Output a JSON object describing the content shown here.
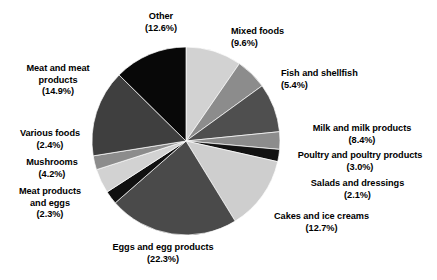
{
  "chart_data": {
    "type": "pie",
    "title": "",
    "subtitle": "",
    "xlabel": "",
    "ylabel": "",
    "legend_position": "outside-labels",
    "grid": false,
    "units": "percent",
    "start_angle_deg": 0,
    "direction": "clockwise",
    "categories": [
      "Mixed foods",
      "Fish and shellfish",
      "Milk and milk products",
      "Poultry and poultry products",
      "Salads and dressings",
      "Cakes and ice creams",
      "Eggs and egg products",
      "Meat products and eggs",
      "Mushrooms",
      "Various foods",
      "Meat and meat products",
      "Other"
    ],
    "values": [
      9.6,
      5.4,
      8.4,
      3.0,
      2.1,
      12.7,
      22.3,
      2.3,
      4.2,
      2.4,
      14.9,
      12.6
    ],
    "colors": [
      "#d2d2d2",
      "#8c8c8c",
      "#4f4f4f",
      "#8c8c8c",
      "#121212",
      "#cecece",
      "#4a4a4a",
      "#101010",
      "#d2d2d2",
      "#8c8c8c",
      "#3f3f3f",
      "#080808"
    ],
    "slices": [
      {
        "name": "Mixed foods",
        "value": 9.6,
        "pct_text": "(9.6%)",
        "color": "#d2d2d2"
      },
      {
        "name": "Fish and shellfish",
        "value": 5.4,
        "pct_text": "(5.4%)",
        "color": "#8c8c8c"
      },
      {
        "name": "Milk and milk products",
        "value": 8.4,
        "pct_text": "(8.4%)",
        "color": "#4f4f4f"
      },
      {
        "name": "Poultry and poultry products",
        "value": 3.0,
        "pct_text": "(3.0%)",
        "color": "#8c8c8c"
      },
      {
        "name": "Salads and dressings",
        "value": 2.1,
        "pct_text": "(2.1%)",
        "color": "#121212"
      },
      {
        "name": "Cakes and ice creams",
        "value": 12.7,
        "pct_text": "(12.7%)",
        "color": "#cecece"
      },
      {
        "name": "Eggs and egg products",
        "value": 22.3,
        "pct_text": "(22.3%)",
        "color": "#4a4a4a"
      },
      {
        "name": "Meat products and eggs",
        "value": 2.3,
        "pct_text": "(2.3%)",
        "color": "#101010"
      },
      {
        "name": "Mushrooms",
        "value": 4.2,
        "pct_text": "(4.2%)",
        "color": "#d2d2d2"
      },
      {
        "name": "Various foods",
        "value": 2.4,
        "pct_text": "(2.4%)",
        "color": "#8c8c8c"
      },
      {
        "name": "Meat and meat products",
        "value": 14.9,
        "pct_text": "(14.9%)",
        "color": "#3f3f3f"
      },
      {
        "name": "Other",
        "value": 12.6,
        "pct_text": "(12.6%)",
        "color": "#080808"
      }
    ]
  },
  "labels": {
    "other": {
      "line1": "Other",
      "line2": "",
      "pct": "(12.6%)"
    },
    "mixed_foods": {
      "line1": "Mixed foods",
      "line2": "",
      "pct": "(9.6%)"
    },
    "fish_shellfish": {
      "line1": "Fish and shellfish",
      "line2": "",
      "pct": "(5.4%)"
    },
    "milk": {
      "line1": "Milk and milk products",
      "line2": "",
      "pct": "(8.4%)"
    },
    "poultry": {
      "line1": "Poultry and poultry products",
      "line2": "",
      "pct": "(3.0%)"
    },
    "salads": {
      "line1": "Salads and dressings",
      "line2": "",
      "pct": "(2.1%)"
    },
    "cakes": {
      "line1": "Cakes and ice creams",
      "line2": "",
      "pct": "(12.7%)"
    },
    "eggs": {
      "line1": "Eggs and egg products",
      "line2": "",
      "pct": "(22.3%)"
    },
    "meat_products_eggs": {
      "line1": "Meat products",
      "line2": "and eggs",
      "pct": "(2.3%)"
    },
    "mushrooms": {
      "line1": "Mushrooms",
      "line2": "",
      "pct": "(4.2%)"
    },
    "various_foods": {
      "line1": "Various foods",
      "line2": "",
      "pct": "(2.4%)"
    },
    "meat_and_meat": {
      "line1": "Meat and meat",
      "line2": "products",
      "pct": "(14.9%)"
    }
  },
  "geometry": {
    "cx": 186,
    "cy": 141,
    "r": 94
  }
}
